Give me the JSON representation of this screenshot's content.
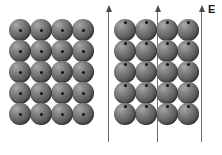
{
  "figure": {
    "width": 222,
    "height": 155,
    "background_color": "#ffffff"
  },
  "field": {
    "label": "E",
    "label_x": 208,
    "label_y": 4,
    "arrow_color": "#6e6e6e",
    "arrow_head_color": "#4a4a4a",
    "arrows": [
      {
        "name": "field-arrow-left",
        "x": 108,
        "y_top": 10,
        "y_bottom": 142
      },
      {
        "name": "field-arrow-middle",
        "x": 157,
        "y_top": 10,
        "y_bottom": 142
      },
      {
        "name": "field-arrow-right",
        "x": 201,
        "y_top": 10,
        "y_bottom": 142
      }
    ]
  },
  "lattices": [
    {
      "name": "unpolarized-lattice",
      "caption": "Unpolarized atoms, nuclei centered",
      "origin_x": 9,
      "origin_y": 19,
      "rows": 5,
      "cols": 4,
      "atom_diameter": 22,
      "spacing_x": 21,
      "spacing_y": 21,
      "nucleus_diameter": 3,
      "nucleus_offset_y": 0,
      "atom_color": "#5c5c5c",
      "nucleus_color": "#111111"
    },
    {
      "name": "polarized-lattice",
      "caption": "Polarized atoms, nuclei displaced along E",
      "origin_x": 114,
      "origin_y": 19,
      "rows": 5,
      "cols": 4,
      "atom_diameter": 22,
      "spacing_x": 21,
      "spacing_y": 21,
      "nucleus_diameter": 3,
      "nucleus_offset_y": -8,
      "atom_color": "#5c5c5c",
      "nucleus_color": "#111111"
    }
  ]
}
